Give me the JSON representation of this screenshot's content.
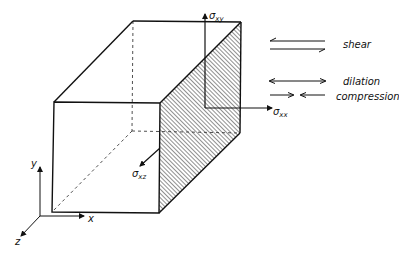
{
  "diagram": {
    "stress_labels": {
      "xy": {
        "sym": "σ",
        "sub": "xy"
      },
      "xx": {
        "sym": "σ",
        "sub": "xx"
      },
      "xz": {
        "sym": "σ",
        "sub": "xz"
      }
    },
    "axes": {
      "x": "x",
      "y": "y",
      "z": "z"
    },
    "legend": [
      {
        "label": "shear",
        "arrow": "opposing-parallel-half-arrows"
      },
      {
        "label": "dilation",
        "arrow": "double-headed-outward"
      },
      {
        "label": "compression",
        "arrow": "double-headed-inward"
      }
    ],
    "colors": {
      "ink": "#111111",
      "background": "#ffffff"
    }
  }
}
